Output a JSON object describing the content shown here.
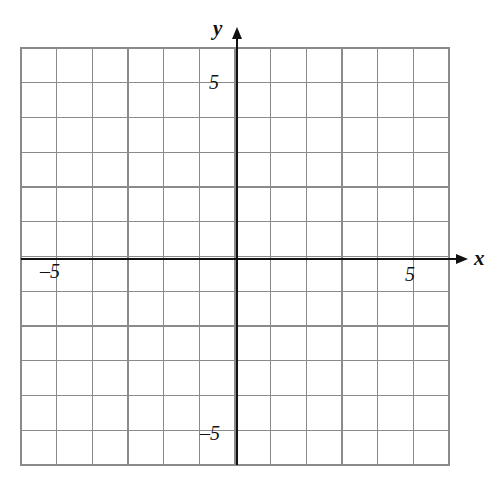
{
  "figure": {
    "kind": "cartesian-coordinate-plane",
    "background_color": "#ffffff",
    "grid_color": "#8a8a8a",
    "axis_color": "#111111",
    "label_color": "#111111"
  },
  "axes": {
    "x_axis_name": "x",
    "y_axis_name": "y",
    "x_axis_arrow": "arrow-right",
    "y_axis_arrow": "arrow-up"
  },
  "tick_labels": {
    "y_positive": "5",
    "y_negative": "–5",
    "x_positive": "5",
    "x_negative": "–5"
  },
  "chart_data": {
    "type": "scatter",
    "title": "",
    "xlabel": "x",
    "ylabel": "y",
    "series": [],
    "x": [],
    "values": [],
    "xlim": [
      -6,
      6
    ],
    "ylim": [
      -6,
      6
    ],
    "xticks": [
      -5,
      5
    ],
    "yticks": [
      -5,
      5
    ],
    "xtick_labels": [
      "–5",
      "5"
    ],
    "ytick_labels": [
      "–5",
      "5"
    ],
    "grid": true,
    "grid_step": 1,
    "grid_columns": 12,
    "grid_rows": 12,
    "legend": "none",
    "annotations": []
  },
  "geometry": {
    "grid_left": 21,
    "grid_right": 449,
    "grid_top": 48,
    "grid_bottom": 465,
    "origin_x": 237,
    "origin_y": 259,
    "cell_width": 35.67,
    "cell_height": 34.75,
    "x_arrow_tip": 468,
    "y_arrow_tip": 27
  }
}
